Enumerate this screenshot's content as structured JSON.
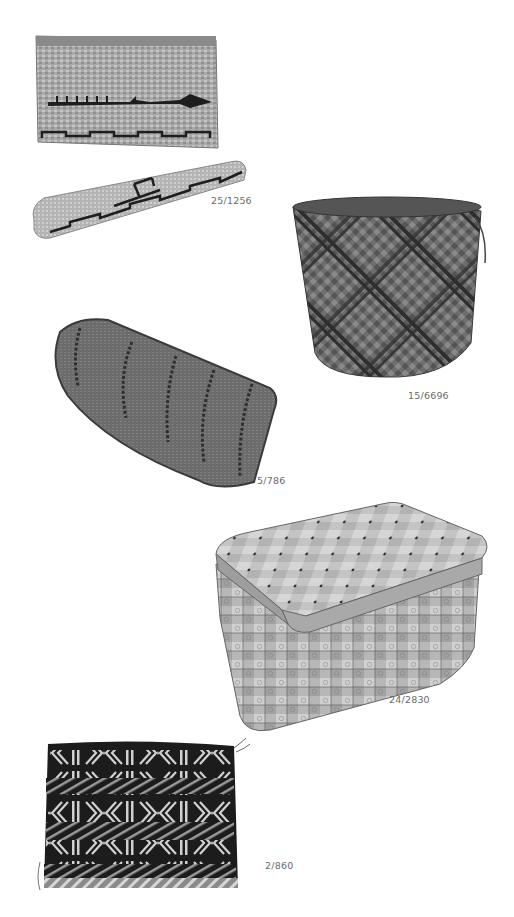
{
  "page": {
    "background": "#ffffff",
    "label_color": "#6a6a6a"
  },
  "objects": [
    {
      "id": "basket-box-with-lid",
      "catalog_number": "25/1256",
      "description": "rectangular twined basket box with canoe and whale motif, with lid"
    },
    {
      "id": "woven-bucket-basket",
      "catalog_number": "15/6696",
      "description": "cylindrical plaited basket with diagonal pattern"
    },
    {
      "id": "boat-shaped-tray",
      "catalog_number": "5/786",
      "description": "boat-shaped woven tray"
    },
    {
      "id": "lidded-splint-box",
      "catalog_number": "24/2830",
      "description": "lidded woven splint box with stamped designs"
    },
    {
      "id": "woven-bag",
      "catalog_number": "2/860",
      "description": "flat woven bag with geometric bands"
    }
  ]
}
